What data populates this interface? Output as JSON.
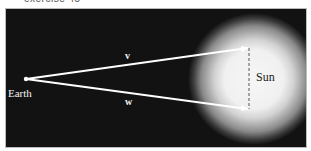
{
  "caption": "exercise 45",
  "diagram": {
    "background": "#121212",
    "labels": {
      "earth": "Earth",
      "sun": "Sun",
      "vector_v": "v",
      "vector_w": "w"
    },
    "colors": {
      "arrow": "#ffffff",
      "sun_core": "#f4f4f4",
      "sun_glow": "#9a9a9a",
      "dashed_line": "#555555"
    }
  }
}
